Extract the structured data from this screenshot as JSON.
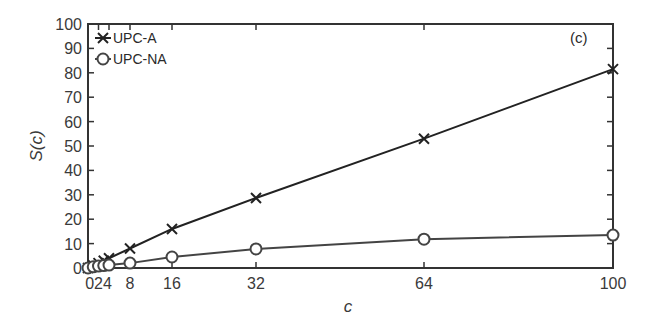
{
  "chart_data": {
    "type": "line",
    "title": "",
    "panel_label": "(c)",
    "xlabel": "c",
    "ylabel": "S(c)",
    "xlim": [
      0,
      100
    ],
    "ylim": [
      0,
      100
    ],
    "grid": false,
    "legend_position": "upper-left",
    "x_ticks": [
      0,
      2,
      4,
      8,
      16,
      32,
      64,
      100
    ],
    "x_tick_labels": [
      "0",
      "2",
      "4",
      "8",
      "16",
      "32",
      "64",
      "100"
    ],
    "y_ticks": [
      0,
      10,
      20,
      30,
      40,
      50,
      60,
      70,
      80,
      90,
      100
    ],
    "y_tick_labels": [
      "0",
      "10",
      "20",
      "30",
      "40",
      "50",
      "60",
      "70",
      "80",
      "90",
      "100"
    ],
    "x": [
      0,
      1,
      2,
      3,
      4,
      8,
      16,
      32,
      64,
      100
    ],
    "series": [
      {
        "name": "UPC-A",
        "marker": "x",
        "color": "#222222",
        "values": [
          0,
          1,
          2,
          3,
          4,
          8,
          16,
          28.7,
          53,
          81.5
        ]
      },
      {
        "name": "UPC-NA",
        "marker": "o",
        "color": "#444444",
        "values": [
          0,
          0.5,
          0.8,
          1.0,
          1.2,
          2,
          4.5,
          7.8,
          11.8,
          13.5
        ]
      }
    ]
  }
}
